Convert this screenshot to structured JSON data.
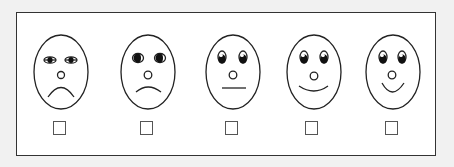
{
  "scale": {
    "frame_border_color": "#333333",
    "faces": [
      {
        "id": "very-sad",
        "cx": 61,
        "cy": 72,
        "rx": 27,
        "ry": 37,
        "eyes": "half-lidded",
        "mouth": "frown-deep"
      },
      {
        "id": "sad",
        "cx": 148,
        "cy": 72,
        "rx": 27,
        "ry": 37,
        "eyes": "side-looking",
        "mouth": "frown"
      },
      {
        "id": "neutral",
        "cx": 233,
        "cy": 72,
        "rx": 27,
        "ry": 37,
        "eyes": "open",
        "mouth": "flat"
      },
      {
        "id": "happy",
        "cx": 314,
        "cy": 72,
        "rx": 27,
        "ry": 37,
        "eyes": "open",
        "mouth": "smile"
      },
      {
        "id": "very-happy",
        "cx": 393,
        "cy": 72,
        "rx": 27,
        "ry": 37,
        "eyes": "open",
        "mouth": "smile-deep"
      }
    ],
    "checkboxes": [
      {
        "x": 53,
        "y": 121,
        "checked": false
      },
      {
        "x": 140,
        "y": 121,
        "checked": false
      },
      {
        "x": 225,
        "y": 121,
        "checked": false
      },
      {
        "x": 305,
        "y": 121,
        "checked": false
      },
      {
        "x": 385,
        "y": 121,
        "checked": false
      }
    ]
  }
}
